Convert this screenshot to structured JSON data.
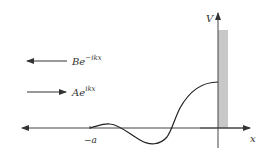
{
  "diagram": {
    "axes": {
      "x_label": "x",
      "y_label": "V",
      "tick_label": "−a"
    },
    "waves": {
      "reflected": {
        "base": "Be",
        "exponent": "−ikx",
        "direction": "left"
      },
      "incident": {
        "base": "Ae",
        "exponent": "ikx",
        "direction": "right"
      }
    },
    "barrier": {
      "color": "#c8c8c8"
    },
    "colors": {
      "line": "#333333",
      "curve": "#222222"
    }
  }
}
